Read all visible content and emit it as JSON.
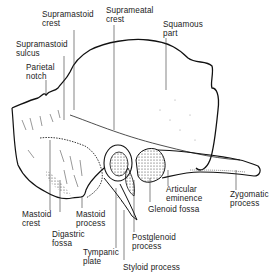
{
  "diagram": {
    "labels": {
      "supramastoid_crest": "Supramastoid\ncrest",
      "suprameatal_crest": "Suprameatal\ncrest",
      "squamous_part": "Squamous\npart",
      "supramastoid_sulcus": "Supramastoid\nsulcus",
      "parietal_notch": "Parietal\nnotch",
      "mastoid_crest": "Mastoid\ncrest",
      "mastoid_process": "Mastoid\nprocess",
      "digastric_fossa": "Digastric\nfossa",
      "tympanic_plate": "Tympanic\nplate",
      "styloid_process": "Styloid process",
      "postglenoid_process": "Postglenoid\nprocess",
      "glenoid_fossa": "Glenoid fossa",
      "articular_eminence": "Articular\neminence",
      "zygomatic_process": "Zygomatic\nprocess"
    },
    "colors": {
      "line": "#111111",
      "stipple": "#555555",
      "text": "#222222",
      "background": "#ffffff"
    }
  }
}
